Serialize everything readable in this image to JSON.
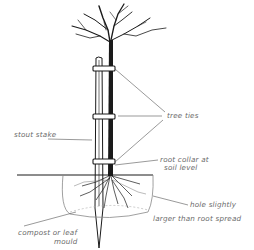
{
  "diagram": {
    "labels": {
      "tree_ties": "tree ties",
      "stout_stake": "stout stake",
      "root_collar_line1": "root collar at",
      "root_collar_line2": "soil level",
      "hole_line1": "hole slightly",
      "hole_line2": "larger than root spread",
      "compost_line1": "compost or leaf",
      "compost_line2": "mould"
    },
    "colors": {
      "ink": "#1a1a1a",
      "label_text": "#6a6a6a",
      "leader_line": "#555555",
      "background": "#ffffff"
    }
  }
}
